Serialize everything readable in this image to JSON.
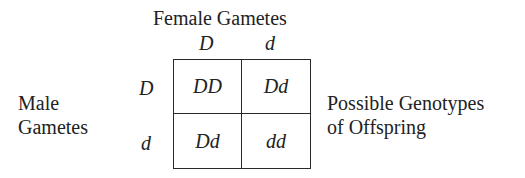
{
  "title": "Female Gametes",
  "female_alleles": [
    "D",
    "d"
  ],
  "male_label": [
    "Male",
    "Gametes"
  ],
  "male_alleles": [
    "D",
    "d"
  ],
  "grid": [
    [
      "DD",
      "Dd"
    ],
    [
      "Dd",
      "dd"
    ]
  ],
  "offspring_label": [
    "Possible Genotypes",
    "of Offspring"
  ]
}
